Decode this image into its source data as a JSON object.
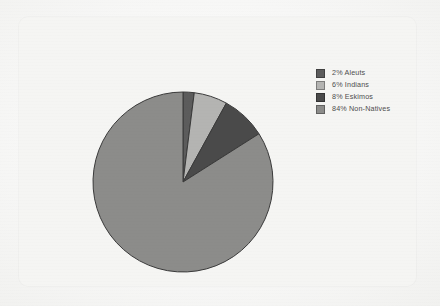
{
  "chart_data": {
    "type": "pie",
    "title": "",
    "categories": [
      "Aleuts",
      "Indians",
      "Eskimos",
      "Non-Natives"
    ],
    "values": [
      2,
      6,
      8,
      84
    ],
    "value_unit": "%",
    "legend_position": "right",
    "grid": false,
    "start_angle_deg": 0,
    "direction": "clockwise",
    "slices": [
      {
        "label": "Aleuts",
        "value": 2,
        "legend_text": "2% Aleuts",
        "color": "#5c5c5c"
      },
      {
        "label": "Indians",
        "value": 6,
        "legend_text": "6% Indians",
        "color": "#b4b4b2"
      },
      {
        "label": "Eskimos",
        "value": 8,
        "legend_text": "8% Eskimos",
        "color": "#4a4a4a"
      },
      {
        "label": "Non-Natives",
        "value": 84,
        "legend_text": "84% Non-Natives",
        "color": "#8c8c8a"
      }
    ]
  },
  "legend": {
    "items": [
      {
        "swatch_name": "legend-swatch-aleuts",
        "text": "2% Aleuts",
        "color": "#5c5c5c"
      },
      {
        "swatch_name": "legend-swatch-indians",
        "text": "6% Indians",
        "color": "#b4b4b2"
      },
      {
        "swatch_name": "legend-swatch-eskimos",
        "text": "8% Eskimos",
        "color": "#4a4a4a"
      },
      {
        "swatch_name": "legend-swatch-non-natives",
        "text": "84% Non-Natives",
        "color": "#8c8c8a"
      }
    ]
  },
  "style": {
    "page_background": "#fbfbfa",
    "panel_background": "#f5f5f3",
    "slice_outline": "#3a3a3a",
    "legend_text_color": "#4e4e4e"
  }
}
